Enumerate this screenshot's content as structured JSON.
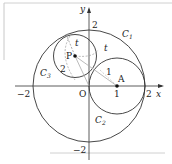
{
  "diagram": {
    "axes": {
      "x_label": "x",
      "y_label": "y",
      "origin_label": "O"
    },
    "ticks": {
      "x_neg": "−2",
      "x_one": "1",
      "x_pos": "2",
      "y_pos": "2",
      "y_neg": "−2"
    },
    "circles": [
      {
        "name": "C1",
        "label": "C",
        "sub": "1",
        "center": [
          0,
          0
        ],
        "radius": 2
      },
      {
        "name": "C2",
        "label": "C",
        "sub": "2",
        "center": [
          1,
          0
        ],
        "radius": 1
      },
      {
        "name": "C3",
        "label": "C",
        "sub": "3",
        "center": [
          -0.5,
          1.05
        ],
        "radius": 0.76
      }
    ],
    "points": [
      {
        "name": "P",
        "label": "P"
      },
      {
        "name": "A",
        "label": "A"
      }
    ],
    "annotations": {
      "t_top": "t",
      "t_right": "t",
      "two": "2",
      "one": "1"
    },
    "colors": {
      "stroke": "#333333",
      "dashed": "#999999",
      "segment": "#aaaaaa",
      "frame": "#cccccc"
    }
  }
}
